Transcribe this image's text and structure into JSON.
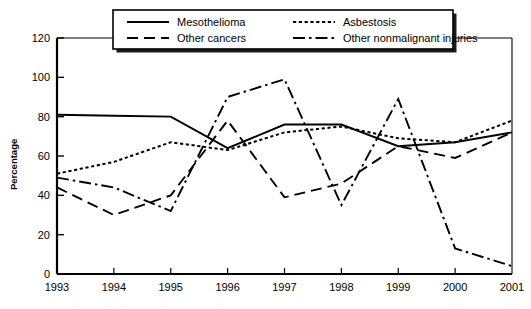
{
  "chart_data": {
    "type": "line",
    "title": "",
    "xlabel": "",
    "ylabel": "Percentage",
    "x": [
      1993,
      1994,
      1995,
      1996,
      1997,
      1998,
      1999,
      2000,
      2001
    ],
    "xticklabels": [
      "1993",
      "1994",
      "1995",
      "1996",
      "1997",
      "1998",
      "1999",
      "2000",
      "2001"
    ],
    "yticklabels": [
      "0",
      "20",
      "40",
      "60",
      "80",
      "100",
      "120"
    ],
    "yticks": [
      0,
      20,
      40,
      60,
      80,
      100,
      120
    ],
    "ylim": [
      0,
      120
    ],
    "xlim": [
      1993,
      2001
    ],
    "grid": false,
    "legend_position": "top-center",
    "series": [
      {
        "name": "Mesothelioma",
        "style": "solid",
        "color": "#000000",
        "values": [
          81,
          80.5,
          80,
          64,
          76,
          76,
          65,
          67,
          72
        ]
      },
      {
        "name": "Asbestosis",
        "style": "dotted",
        "color": "#000000",
        "values": [
          51,
          57,
          67,
          63,
          72,
          75,
          69,
          67,
          78
        ]
      },
      {
        "name": "Other cancers",
        "style": "dashed",
        "color": "#000000",
        "values": [
          44,
          30,
          40,
          78,
          39,
          46,
          65,
          59,
          72
        ]
      },
      {
        "name": "Other nonmalignant injuries",
        "style": "dashdot",
        "color": "#000000",
        "values": [
          49,
          44,
          32,
          90,
          99,
          35,
          89,
          13,
          4
        ]
      }
    ]
  },
  "legend": {
    "items": [
      {
        "label": "Mesothelioma",
        "style": "solid"
      },
      {
        "label": "Asbestosis",
        "style": "dotted"
      },
      {
        "label": "Other cancers",
        "style": "dashed"
      },
      {
        "label": "Other nonmalignant injuries",
        "style": "dashdot"
      }
    ]
  },
  "colors": {
    "ink": "#000000",
    "background": "#ffffff",
    "shadow": "#1a1a1a"
  }
}
